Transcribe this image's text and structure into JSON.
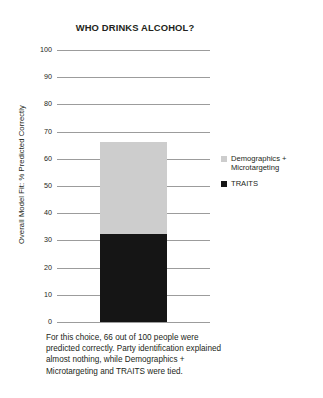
{
  "chart_data": {
    "type": "bar",
    "title": "WHO DRINKS ALCOHOL?",
    "xlabel": "",
    "ylabel": "Overall Model Fit: % Predicted Correctly",
    "ylim": [
      0,
      100
    ],
    "ytick_step": 10,
    "yticks": [
      100,
      90,
      80,
      70,
      60,
      50,
      40,
      30,
      20,
      10,
      0
    ],
    "grid": true,
    "stacked": true,
    "categories": [
      "Overall model"
    ],
    "series": [
      {
        "name": "TRAITS",
        "values": [
          32.5
        ],
        "color": "#151515"
      },
      {
        "name": "Demographics + Microtargeting",
        "values": [
          33.5
        ],
        "color": "#cdcdcd"
      }
    ],
    "total": 66,
    "legend_position": "right",
    "legend": [
      {
        "label": "Demographics + Microtargeting",
        "color": "#cdcdcd",
        "swatch": "light"
      },
      {
        "label": "TRAITS",
        "color": "#151515",
        "swatch": "dark"
      }
    ],
    "annotation": "For this choice, 66 out of 100 people were predicted correctly. Party identification explained almost nothing, while Demographics + Microtargeting and TRAITS were tied."
  },
  "colors": {
    "background": "#ffffff",
    "text": "#231f20",
    "gridline": "#9c9c9c",
    "series_light": "#cdcdcd",
    "series_dark": "#151515"
  }
}
